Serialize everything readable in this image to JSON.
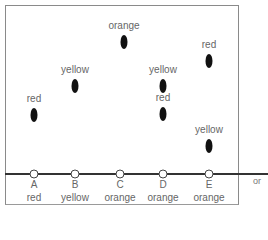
{
  "diagram": {
    "columns": [
      {
        "letter": "A",
        "name": "red",
        "x": 34
      },
      {
        "letter": "B",
        "name": "yellow",
        "x": 75
      },
      {
        "letter": "C",
        "name": "orange",
        "x": 120
      },
      {
        "letter": "D",
        "name": "orange",
        "x": 163
      },
      {
        "letter": "E",
        "name": "orange",
        "x": 209
      }
    ],
    "points": [
      {
        "column": "A",
        "label": "red",
        "x": 34,
        "y": 115
      },
      {
        "column": "B",
        "label": "yellow",
        "x": 75,
        "y": 86
      },
      {
        "column": "C",
        "label": "orange",
        "x": 124,
        "y": 42
      },
      {
        "column": "D",
        "label": "yellow",
        "x": 163,
        "y": 86
      },
      {
        "column": "D",
        "label": "red",
        "x": 163,
        "y": 114
      },
      {
        "column": "E",
        "label": "red",
        "x": 209,
        "y": 61
      },
      {
        "column": "E",
        "label": "yellow",
        "x": 209,
        "y": 146
      }
    ],
    "side_text": "or"
  }
}
